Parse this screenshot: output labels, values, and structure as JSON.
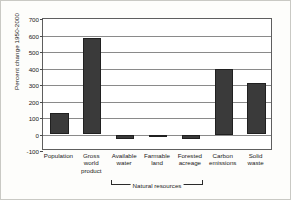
{
  "chart_data": {
    "type": "bar",
    "title": "",
    "xlabel": "Natural resources",
    "ylabel": "Percent change 1950-2000",
    "categories": [
      "Population",
      "Gross world product",
      "Available water",
      "Farmable land",
      "Forested acreage",
      "Carbon emissions",
      "Solid waste"
    ],
    "category_lines": [
      [
        "Population"
      ],
      [
        "Gross",
        "world",
        "product"
      ],
      [
        "Available",
        "water"
      ],
      [
        "Farmable",
        "land"
      ],
      [
        "Forested",
        "acreage"
      ],
      [
        "Carbon",
        "emissions"
      ],
      [
        "Solid",
        "waste"
      ]
    ],
    "values": [
      130,
      585,
      -25,
      -8,
      -30,
      400,
      310
    ],
    "ylim": [
      -100,
      700
    ],
    "yticks": [
      700,
      600,
      500,
      400,
      300,
      200,
      100,
      0,
      -100
    ],
    "ytick_labels": [
      "700",
      "600",
      "500",
      "400",
      "300",
      "200",
      "100",
      "0",
      "-100"
    ],
    "grid": true,
    "legend": "none",
    "bar_color": "#3a3a3a",
    "axis_color": "#5e5e5e",
    "grid_color": "#8a8a8a",
    "group_bracket": {
      "label": "Natural resources",
      "from_category": "Available water",
      "to_category": "Forested acreage"
    }
  }
}
